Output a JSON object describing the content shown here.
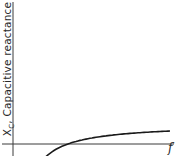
{
  "chart_data": {
    "type": "line",
    "title": "",
    "xlabel": "f",
    "ylabel": "X_C, Capacitive reactance",
    "ylabel_parts": {
      "symbol": "X",
      "subscript": "C",
      "text": ", Capacitive reactance"
    },
    "grid": false,
    "legend": null,
    "axis_ticks": false,
    "series": [
      {
        "name": "X_C",
        "x": [
          0.05,
          0.1,
          0.2,
          0.3,
          0.4,
          0.5,
          0.6,
          0.7,
          0.8,
          0.9,
          1.0
        ],
        "values": [
          1.0,
          0.5,
          0.25,
          0.167,
          0.125,
          0.1,
          0.083,
          0.071,
          0.0625,
          0.056,
          0.05
        ]
      }
    ],
    "colors": {
      "curve": "#1a1a1a",
      "axes": "#3a3a3a"
    }
  }
}
